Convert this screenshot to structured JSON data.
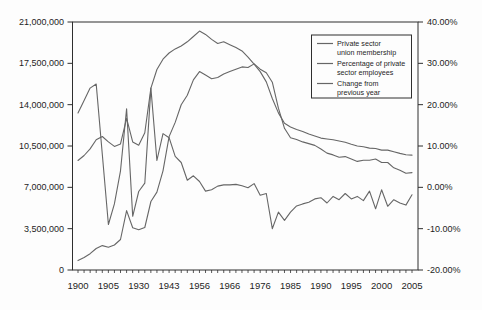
{
  "chart_data": {
    "type": "line",
    "title": "",
    "x_axis": {
      "categories": [
        1900,
        1901,
        1902,
        1903,
        1904,
        1905,
        1910,
        1915,
        1920,
        1925,
        1930,
        1935,
        1937,
        1939,
        1941,
        1943,
        1945,
        1947,
        1950,
        1953,
        1956,
        1958,
        1960,
        1962,
        1964,
        1966,
        1968,
        1970,
        1972,
        1974,
        1976,
        1978,
        1980,
        1982,
        1984,
        1985,
        1986,
        1987,
        1988,
        1989,
        1990,
        1991,
        1992,
        1993,
        1994,
        1995,
        1996,
        1997,
        1998,
        1999,
        2000,
        2001,
        2002,
        2003,
        2004,
        2005
      ],
      "visible_tick_labels": [
        "1900",
        "1905",
        "1930",
        "1943",
        "1956",
        "1966",
        "1976",
        "1985",
        "1990",
        "1995",
        "2000",
        "2005"
      ],
      "label_every_n_categories": 5
    },
    "left_axis": {
      "min": 0,
      "max": 21000000,
      "tick_values": [
        0,
        3500000,
        7000000,
        10500000,
        14000000,
        17500000,
        21000000
      ],
      "tick_labels": [
        "0",
        "3,500,000",
        "7,000,000",
        "10,500,000",
        "14,000,000",
        "17,500,000",
        "21,000,000"
      ]
    },
    "right_axis": {
      "min": -20,
      "max": 40,
      "tick_values": [
        -20,
        -10,
        0,
        10,
        20,
        30,
        40
      ],
      "tick_labels": [
        "-20.00%",
        "-10.00%",
        "0.00%",
        "10.00%",
        "20.00%",
        "30.00%",
        "40.00%"
      ]
    },
    "series": [
      {
        "name": "Private sector union membership",
        "legend_lines": [
          "Private sector",
          "union membership"
        ],
        "axis": "left",
        "values": [
          800000,
          1060000,
          1380000,
          1820000,
          2070000,
          1920000,
          2120000,
          2580000,
          5030000,
          3570000,
          3400000,
          3600000,
          5800000,
          6600000,
          8400000,
          11300000,
          12500000,
          14000000,
          14800000,
          16100000,
          16800000,
          16500000,
          16200000,
          16300000,
          16600000,
          16800000,
          17000000,
          17200000,
          17150000,
          17450000,
          17000000,
          16700000,
          15900000,
          13700000,
          12000000,
          11200000,
          11050000,
          10850000,
          10700000,
          10550000,
          10250000,
          9900000,
          9750000,
          9550000,
          9600000,
          9400000,
          9200000,
          9300000,
          9300000,
          9400000,
          9100000,
          9100000,
          8650000,
          8450000,
          8200000,
          8250000
        ]
      },
      {
        "name": "Percentage of private sector employees",
        "legend_lines": [
          "Percentage of private",
          "sector employees"
        ],
        "axis": "right",
        "values": [
          6.5,
          7.7,
          9.3,
          11.5,
          12.3,
          11.0,
          9.9,
          10.5,
          16.7,
          11.0,
          10.2,
          13.2,
          24.0,
          28.5,
          31.0,
          32.5,
          33.5,
          34.2,
          35.2,
          36.5,
          37.8,
          37.0,
          35.8,
          34.8,
          35.2,
          34.5,
          33.8,
          33.0,
          31.5,
          29.8,
          28.0,
          25.5,
          21.5,
          18.0,
          15.5,
          14.6,
          14.0,
          13.5,
          12.9,
          12.4,
          11.9,
          11.7,
          11.5,
          11.2,
          10.9,
          10.4,
          10.0,
          9.8,
          9.5,
          9.4,
          9.0,
          9.0,
          8.6,
          8.2,
          7.9,
          7.8
        ]
      },
      {
        "name": "Change from previous year",
        "legend_lines": [
          "Change from",
          "previous year"
        ],
        "axis": "right",
        "values": [
          18,
          21,
          24,
          25,
          8,
          -9,
          -4,
          4,
          19,
          -7,
          -1,
          1,
          24,
          6.5,
          13,
          12,
          7.5,
          6,
          1.7,
          2.8,
          1.4,
          -0.9,
          -0.6,
          0.3,
          0.6,
          0.6,
          0.7,
          0.4,
          -0.1,
          0.9,
          -1.9,
          -1.5,
          -10.0,
          -6.0,
          -8.0,
          -6.0,
          -4.5,
          -4.0,
          -3.6,
          -2.8,
          -2.5,
          -3.8,
          -2.2,
          -3.0,
          -1.5,
          -2.8,
          -2.2,
          -3.2,
          -0.9,
          -5.2,
          -0.6,
          -4.6,
          -3.0,
          -3.8,
          -4.3,
          -1.8
        ]
      }
    ],
    "legend": {
      "position": "top-right"
    },
    "style": {
      "line_color": "#666666",
      "axis_color": "#2f2f2f",
      "text_color": "#1d1d1d",
      "background": "#fdfdfd",
      "grid": "off"
    }
  }
}
